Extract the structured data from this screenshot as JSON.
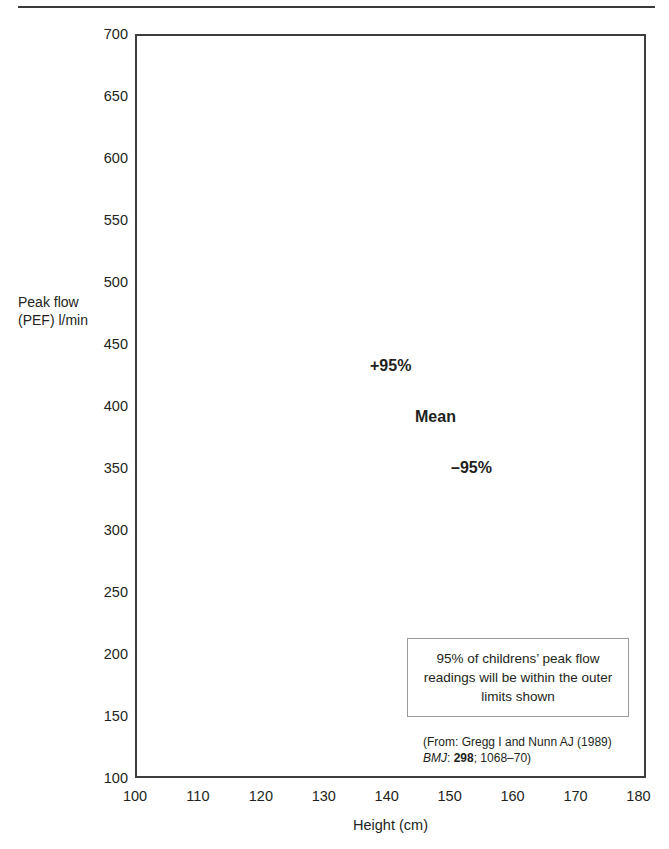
{
  "figure": {
    "ylabel_line1": "Peak flow",
    "ylabel_line2": "(PEF) l/min",
    "xlabel": "Height (cm)",
    "callout": "95% of childrens’ peak flow readings will be within the outer limits shown",
    "source": {
      "line1": "(From: Gregg I and Nunn AJ (1989)",
      "journal": "BMJ",
      "sep1": ": ",
      "volume": "298",
      "line2_tail": "; 1068–70)"
    }
  },
  "chart_data": {
    "type": "line",
    "title": "",
    "xlabel": "Height (cm)",
    "ylabel": "Peak flow (PEF) l/min",
    "xlim": [
      100,
      181.2
    ],
    "ylim": [
      100,
      700
    ],
    "xticks": [
      100,
      110,
      120,
      130,
      140,
      150,
      160,
      170,
      180
    ],
    "yticks": [
      100,
      150,
      200,
      250,
      300,
      350,
      400,
      450,
      500,
      550,
      600,
      650,
      700
    ],
    "xtick_labels": [
      "100",
      "110",
      "120",
      "130",
      "140",
      "150",
      "160",
      "170",
      "180"
    ],
    "ytick_labels": [
      "100",
      "150",
      "200",
      "250",
      "300",
      "350",
      "400",
      "450",
      "500",
      "550",
      "600",
      "650",
      "700"
    ],
    "grid": true,
    "legend": "in-plot labels",
    "line_color": "#8a8a8a",
    "grid_color": "#dcdcdc",
    "frame_color": "#3d3d3d",
    "series": [
      {
        "name": "+95%",
        "label": "+95%",
        "x": [
          100,
          181.2
        ],
        "y": [
          188,
          657
        ],
        "annotation_at": {
          "x": 115.5,
          "y": 459
        }
      },
      {
        "name": "Mean",
        "label": "Mean",
        "x": [
          100,
          181.2
        ],
        "y": [
          100,
          580
        ],
        "annotation_at": {
          "x": 122.7,
          "y": 418
        }
      },
      {
        "name": "-95%",
        "label": "–95%",
        "x": [
          113.8,
          181.2
        ],
        "y": [
          100,
          500
        ],
        "annotation_at": {
          "x": 128.5,
          "y": 377
        }
      }
    ]
  }
}
